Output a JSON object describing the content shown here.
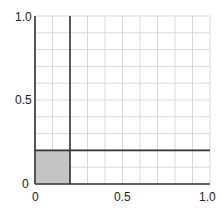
{
  "chart_data": {
    "type": "area",
    "title": "",
    "xlabel": "",
    "ylabel": "",
    "xlim": [
      0,
      1.0
    ],
    "ylim": [
      0,
      1.0
    ],
    "grid": true,
    "grid_step": 0.1,
    "x_ticks": [
      "0",
      "0.5",
      "1.0"
    ],
    "y_ticks": [
      "0",
      "0.5",
      "1.0"
    ],
    "lines": [
      {
        "orientation": "vertical",
        "x": 0.2
      },
      {
        "orientation": "horizontal",
        "y": 0.2
      }
    ],
    "shaded_region": {
      "x": [
        0,
        0.2
      ],
      "y": [
        0,
        0.2
      ],
      "color": "#c4c4c4"
    }
  },
  "colors": {
    "axis": "#333333",
    "grid": "#d9d9d9",
    "shade": "#c4c4c4"
  }
}
